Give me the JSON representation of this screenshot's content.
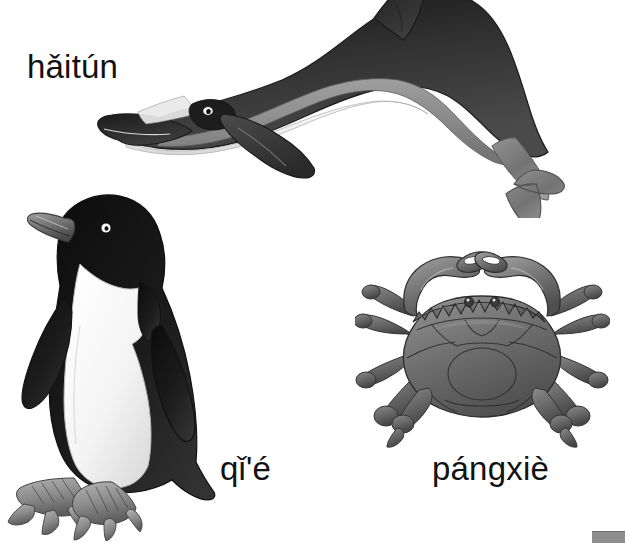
{
  "page": {
    "width": 625,
    "height": 543,
    "background_color": "#ffffff",
    "kind": "vocabulary-illustration-page"
  },
  "palette": {
    "ink": "#121212",
    "black": "#1a1a1a",
    "dark_grey": "#3a3a3a",
    "mid_grey": "#7b7b7b",
    "light_grey": "#b9b9b9",
    "pale_grey": "#e2e2e2",
    "white": "#ffffff",
    "outline": "#2b2b2b",
    "corner_bar": "#8e8e8e"
  },
  "labels": [
    {
      "id": "dolphin",
      "text": "hǎitún",
      "icon": "dolphin-icon",
      "animal": "dolphin",
      "x": 27,
      "y": 50
    },
    {
      "id": "penguin",
      "text": "qǐ'é",
      "icon": "penguin-icon",
      "animal": "penguin",
      "x": 220,
      "y": 452
    },
    {
      "id": "crab",
      "text": "pángxiè",
      "icon": "crab-icon",
      "animal": "crab",
      "x": 432,
      "y": 452
    }
  ],
  "illustrations": [
    {
      "id": "dolphin",
      "name": "dolphin-illustration",
      "description": "Leaping dolphin facing left, dark grey back, light grey flank stripe, white belly, dorsal fin cropped at top edge, tail fluke lower right",
      "colors": [
        "#2e2e2e",
        "#8a8a8a",
        "#f2f2f2"
      ]
    },
    {
      "id": "penguin",
      "name": "penguin-illustration",
      "description": "Standing penguin facing left, black head and back, white chest and belly, grey beak, scaly webbed grey feet",
      "colors": [
        "#171717",
        "#fbfbfb",
        "#8d8d8d"
      ]
    },
    {
      "id": "crab",
      "name": "crab-illustration",
      "description": "Crab viewed from above, broad grey carapace, two raised claws meeting at the top, eight walking legs with paddle tips",
      "colors": [
        "#6f6f6f",
        "#9a9a9a",
        "#4a4a4a"
      ]
    }
  ],
  "corner_bar": {
    "name": "corner-marker",
    "color": "#8e8e8e"
  }
}
